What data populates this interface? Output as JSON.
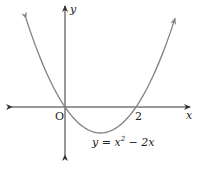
{
  "chart_data": {
    "type": "line",
    "title": "",
    "equation": "y = x^2 - 2x",
    "xlabel": "x",
    "ylabel": "y",
    "origin_label": "O",
    "x_ticks": [
      {
        "value": 2,
        "label": "2"
      }
    ],
    "roots": [
      0,
      2
    ],
    "vertex": [
      1,
      -1
    ],
    "x_range_shown": [
      -1.1,
      3.1
    ],
    "series": [
      {
        "name": "y = x^2 - 2x",
        "x": [
          -1.1,
          -1,
          -0.5,
          0,
          0.5,
          1,
          1.5,
          2,
          2.5,
          3,
          3.1
        ],
        "y": [
          3.41,
          3,
          1.25,
          0,
          -0.75,
          -1,
          -0.75,
          0,
          1.25,
          3,
          3.41
        ]
      }
    ],
    "grid": false,
    "legend": "none",
    "colors": {
      "curve": "#808080",
      "axes": "#333333"
    }
  },
  "labels": {
    "y_axis": "y",
    "x_axis": "x",
    "origin": "O",
    "tick_2": "2",
    "eq_prefix": "y = x",
    "eq_exp": "2",
    "eq_suffix": " − 2x"
  }
}
